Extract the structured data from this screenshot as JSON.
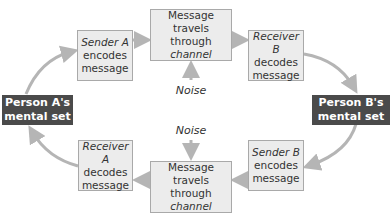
{
  "diagram": {
    "type": "communication-process-cycle",
    "nodes": {
      "person_a": {
        "line1": "Person A's",
        "line2": "mental set"
      },
      "person_b": {
        "line1": "Person B's",
        "line2": "mental set"
      },
      "sender_a": {
        "role": "Sender A",
        "line2": "encodes",
        "line3": "message"
      },
      "channel_top": {
        "line1": "Message",
        "line2": "travels through",
        "line3": "channel"
      },
      "receiver_b": {
        "role": "Receiver B",
        "line2": "decodes",
        "line3": "message"
      },
      "sender_b": {
        "role": "Sender B",
        "line2": "encodes",
        "line3": "message"
      },
      "channel_bottom": {
        "line1": "Message",
        "line2": "travels through",
        "line3": "channel"
      },
      "receiver_a": {
        "role": "Receiver A",
        "line2": "decodes",
        "line3": "message"
      }
    },
    "noise_top": "Noise",
    "noise_bottom": "Noise",
    "colors": {
      "box_fill": "#ececec",
      "box_border": "#a9a9a9",
      "person_fill": "#4a4a4a",
      "arrow": "#b5b5b5"
    }
  }
}
